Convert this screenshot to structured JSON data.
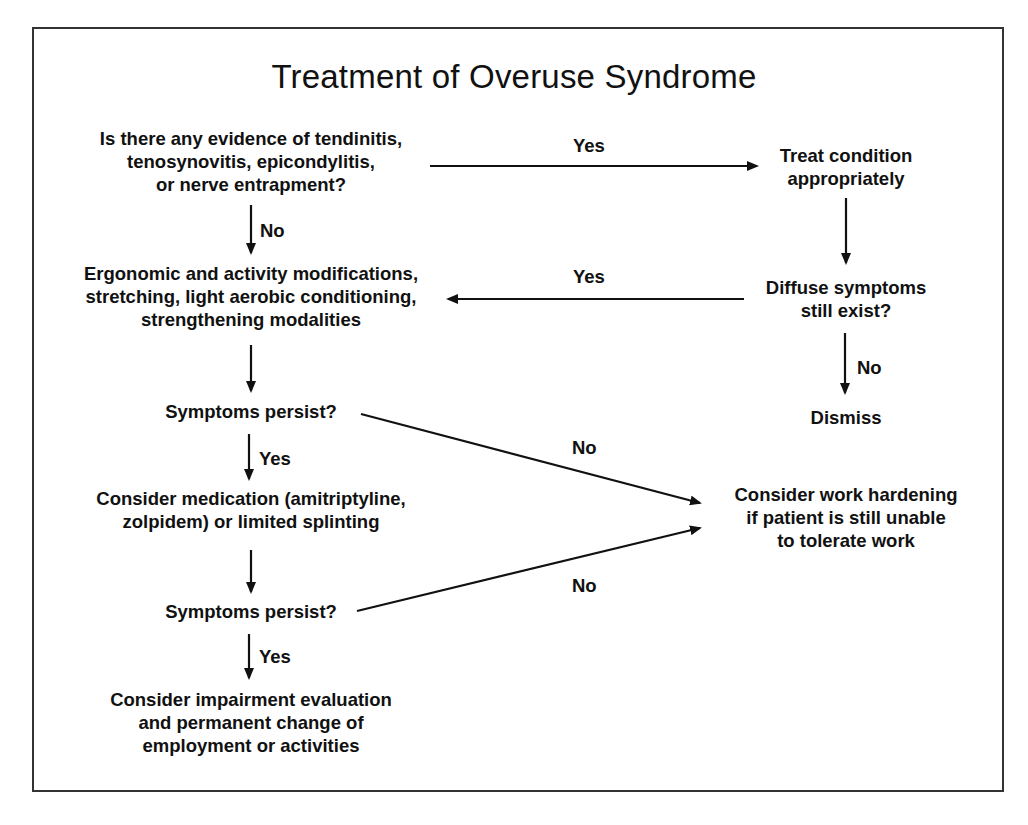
{
  "diagram": {
    "title": "Treatment of Overuse Syndrome",
    "nodes": {
      "evidence_question": {
        "lines": [
          "Is there any evidence of tendinitis,",
          "tenosynovitis, epicondylitis,",
          "or nerve entrapment?"
        ]
      },
      "treat_condition": {
        "lines": [
          "Treat condition",
          "appropriately"
        ]
      },
      "ergonomic_mods": {
        "lines": [
          "Ergonomic and activity modifications,",
          "stretching, light aerobic conditioning,",
          "strengthening modalities"
        ]
      },
      "diffuse_symptoms": {
        "lines": [
          "Diffuse symptoms",
          "still exist?"
        ]
      },
      "dismiss": {
        "lines": [
          "Dismiss"
        ]
      },
      "symptoms_persist_1": {
        "lines": [
          "Symptoms persist?"
        ]
      },
      "medication": {
        "lines": [
          "Consider medication (amitriptyline,",
          "zolpidem) or limited splinting"
        ]
      },
      "work_hardening": {
        "lines": [
          "Consider work hardening",
          "if patient is still unable",
          "to tolerate work"
        ]
      },
      "symptoms_persist_2": {
        "lines": [
          "Symptoms persist?"
        ]
      },
      "impairment_eval": {
        "lines": [
          "Consider impairment evaluation",
          "and permanent change of",
          "employment or activities"
        ]
      }
    },
    "edges": [
      {
        "from": "evidence_question",
        "to": "treat_condition",
        "label": "Yes"
      },
      {
        "from": "evidence_question",
        "to": "ergonomic_mods",
        "label": "No"
      },
      {
        "from": "treat_condition",
        "to": "diffuse_symptoms",
        "label": ""
      },
      {
        "from": "diffuse_symptoms",
        "to": "ergonomic_mods",
        "label": "Yes"
      },
      {
        "from": "diffuse_symptoms",
        "to": "dismiss",
        "label": "No"
      },
      {
        "from": "ergonomic_mods",
        "to": "symptoms_persist_1",
        "label": ""
      },
      {
        "from": "symptoms_persist_1",
        "to": "medication",
        "label": "Yes"
      },
      {
        "from": "symptoms_persist_1",
        "to": "work_hardening",
        "label": "No"
      },
      {
        "from": "medication",
        "to": "symptoms_persist_2",
        "label": ""
      },
      {
        "from": "symptoms_persist_2",
        "to": "impairment_eval",
        "label": "Yes"
      },
      {
        "from": "symptoms_persist_2",
        "to": "work_hardening",
        "label": "No"
      }
    ],
    "colors": {
      "ink": "#111111",
      "frame": "#333333",
      "background": "#ffffff"
    }
  }
}
